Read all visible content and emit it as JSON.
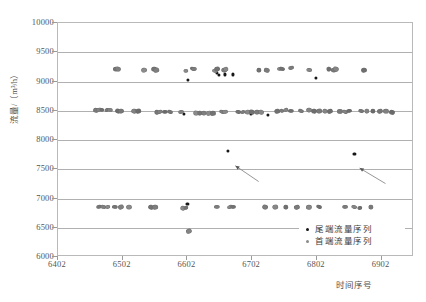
{
  "chart_data": {
    "type": "scatter",
    "title": "",
    "xlabel": "时间序号",
    "ylabel": "流量/（m³/h）",
    "xlim": [
      6402,
      6952
    ],
    "ylim": [
      6000,
      10000
    ],
    "xticks": [
      6402,
      6502,
      6602,
      6702,
      6802,
      6902
    ],
    "yticks": [
      6000,
      6500,
      7000,
      7500,
      8000,
      8500,
      9000,
      9500,
      10000
    ],
    "grid": true,
    "legend_position": "bottom-right",
    "series": [
      {
        "name": "尾端流量序列",
        "color": "#161616",
        "points": [
          [
            6603,
            9030
          ],
          [
            6648,
            9145
          ],
          [
            6650,
            9115
          ],
          [
            6660,
            9120
          ],
          [
            6672,
            9120
          ],
          [
            6800,
            9055
          ],
          [
            6602,
            6905
          ],
          [
            6665,
            7810
          ],
          [
            6860,
            7755
          ],
          [
            6596,
            8440
          ],
          [
            6640,
            8440
          ],
          [
            6700,
            8445
          ],
          [
            6726,
            8435
          ]
        ]
      },
      {
        "name": "首端流量序列",
        "color": "#7a7a7a",
        "points": [
          [
            6492,
            9215
          ],
          [
            6495,
            9210
          ],
          [
            6535,
            9205
          ],
          [
            6550,
            9210
          ],
          [
            6553,
            9205
          ],
          [
            6600,
            9180
          ],
          [
            6610,
            9215
          ],
          [
            6612,
            9210
          ],
          [
            6645,
            9175
          ],
          [
            6648,
            9210
          ],
          [
            6658,
            9205
          ],
          [
            6662,
            9215
          ],
          [
            6712,
            9195
          ],
          [
            6725,
            9195
          ],
          [
            6745,
            9215
          ],
          [
            6748,
            9210
          ],
          [
            6762,
            9230
          ],
          [
            6790,
            9200
          ],
          [
            6820,
            9215
          ],
          [
            6828,
            9200
          ],
          [
            6832,
            9210
          ],
          [
            6875,
            9195
          ],
          [
            6460,
            8510
          ],
          [
            6465,
            8505
          ],
          [
            6470,
            8510
          ],
          [
            6478,
            8510
          ],
          [
            6482,
            8505
          ],
          [
            6495,
            8500
          ],
          [
            6500,
            8500
          ],
          [
            6520,
            8495
          ],
          [
            6525,
            8495
          ],
          [
            6555,
            8480
          ],
          [
            6560,
            8485
          ],
          [
            6568,
            8480
          ],
          [
            6575,
            8485
          ],
          [
            6592,
            8480
          ],
          [
            6615,
            8470
          ],
          [
            6622,
            8465
          ],
          [
            6628,
            8470
          ],
          [
            6635,
            8465
          ],
          [
            6642,
            8460
          ],
          [
            6655,
            8475
          ],
          [
            6660,
            8480
          ],
          [
            6680,
            8480
          ],
          [
            6688,
            8480
          ],
          [
            6695,
            8485
          ],
          [
            6702,
            8480
          ],
          [
            6710,
            8480
          ],
          [
            6715,
            8485
          ],
          [
            6740,
            8490
          ],
          [
            6748,
            8500
          ],
          [
            6755,
            8505
          ],
          [
            6762,
            8500
          ],
          [
            6778,
            8500
          ],
          [
            6790,
            8505
          ],
          [
            6798,
            8500
          ],
          [
            6805,
            8495
          ],
          [
            6815,
            8490
          ],
          [
            6822,
            8495
          ],
          [
            6838,
            8490
          ],
          [
            6845,
            8485
          ],
          [
            6852,
            8490
          ],
          [
            6870,
            8495
          ],
          [
            6880,
            8495
          ],
          [
            6888,
            8500
          ],
          [
            6900,
            8490
          ],
          [
            6908,
            8490
          ],
          [
            6918,
            8485
          ],
          [
            6465,
            6860
          ],
          [
            6472,
            6855
          ],
          [
            6480,
            6855
          ],
          [
            6490,
            6855
          ],
          [
            6500,
            6855
          ],
          [
            6512,
            6850
          ],
          [
            6545,
            6855
          ],
          [
            6552,
            6850
          ],
          [
            6595,
            6845
          ],
          [
            6600,
            6845
          ],
          [
            6648,
            6850
          ],
          [
            6668,
            6855
          ],
          [
            6672,
            6860
          ],
          [
            6722,
            6855
          ],
          [
            6738,
            6855
          ],
          [
            6755,
            6855
          ],
          [
            6772,
            6855
          ],
          [
            6790,
            6850
          ],
          [
            6805,
            6855
          ],
          [
            6845,
            6855
          ],
          [
            6860,
            6850
          ],
          [
            6868,
            6845
          ],
          [
            6885,
            6850
          ],
          [
            6605,
            6445
          ]
        ]
      }
    ],
    "annotations": [
      {
        "name": "arrow-to-outlier-1",
        "tip_x": 6676,
        "tip_y": 7560,
        "tail_x": 6712,
        "tail_y": 7290
      },
      {
        "name": "arrow-to-outlier-2",
        "tip_x": 6868,
        "tip_y": 7520,
        "tail_x": 6908,
        "tail_y": 7255
      }
    ]
  },
  "axis": {
    "y_title": "流量/（m³/h）",
    "x_title": "时间序号",
    "y_tick_labels": [
      "10000",
      "9500",
      "9000",
      "8500",
      "8000",
      "7500",
      "7000",
      "6500",
      "6000"
    ],
    "x_tick_labels": [
      "6402",
      "6502",
      "6602",
      "6702",
      "6802",
      "6902"
    ]
  },
  "legend": {
    "items": [
      {
        "label": "尾端流量序列",
        "marker": "tail"
      },
      {
        "label": "首端流量序列",
        "marker": "head"
      }
    ]
  }
}
